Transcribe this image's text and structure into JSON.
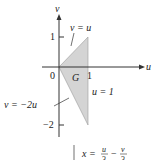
{
  "figure": {
    "axes": {
      "horizontal_label": "u",
      "vertical_label": "v",
      "origin_label": "0",
      "tick_u_1": "1",
      "tick_v_1": "1",
      "tick_v_neg2": "−2"
    },
    "region": {
      "label": "G",
      "vertices": [
        [
          0,
          0
        ],
        [
          1,
          1
        ],
        [
          1,
          -2
        ]
      ],
      "fill_color": "#d4d4d4"
    },
    "annotations": {
      "line_upper": "v = u",
      "line_lower": "v = −2u",
      "line_right": "u = 1"
    },
    "equation": {
      "lhs": "x =",
      "term1_num": "u",
      "term1_den": "3",
      "minus": "−",
      "term2_num": "v",
      "term2_den": "3"
    }
  }
}
